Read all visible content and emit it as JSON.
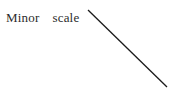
{
  "figure": {
    "width": 170,
    "height": 92,
    "background_color": "#ffffff"
  },
  "annotation": {
    "label": "Minor  scale",
    "text_color": "#2b2b2b",
    "font_size_px": 13,
    "position": {
      "left": 6,
      "top": 10
    }
  },
  "leader_line": {
    "name": "leader-line",
    "color": "#1a1a1a",
    "stroke_width": 1.3,
    "x1": 88,
    "y1": 10,
    "x2": 167,
    "y2": 87
  }
}
